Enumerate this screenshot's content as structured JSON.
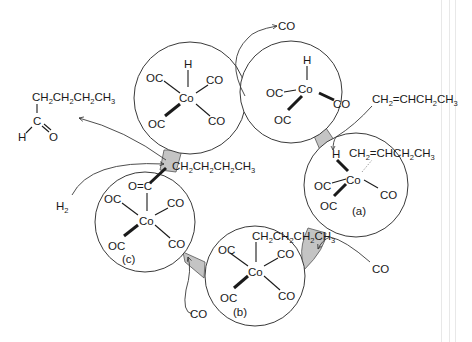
{
  "diagram": {
    "type": "catalytic-cycle",
    "product": {
      "chain": "CH2CH2CH2CH3",
      "carbon": "C",
      "hydrogen": "H",
      "oxygen": "O"
    },
    "reagents": {
      "co_out_top": "CO",
      "butene_in": "CH2=CHCH2CH3",
      "co_in_right": "CO",
      "co_in_bottom": "CO",
      "h2_in": "H2"
    },
    "complexes": [
      {
        "id": "HCo(CO)4",
        "center": "Co",
        "ligands": {
          "top": "H",
          "upper_left": "OC",
          "upper_right": "CO",
          "lower_left": "OC",
          "lower_right": "CO"
        }
      },
      {
        "id": "HCo(CO)3",
        "center": "Co",
        "ligands": {
          "top": "H",
          "left": "OC",
          "right": "CO",
          "lower_left": "OC"
        }
      },
      {
        "id": "a",
        "label": "(a)",
        "center": "Co",
        "ligands": {
          "top_left": "H",
          "pi": "CH2=CHCH2CH3",
          "left": "OC",
          "right": "CO",
          "lower_left": "OC"
        }
      },
      {
        "id": "b",
        "label": "(b)",
        "center": "Co",
        "ligands": {
          "top": "CH2CH2CH2CH3",
          "upper_left": "OC",
          "upper_right": "CO",
          "lower_left": "OC",
          "lower_right": "CO"
        }
      },
      {
        "id": "c",
        "label": "(c)",
        "center": "Co",
        "ligands": {
          "top": "O=C",
          "acyl_chain": "CH2CH2CH2CH3",
          "upper_left": "OC",
          "upper_right": "CO",
          "lower_left": "OC",
          "lower_right": "CO"
        }
      }
    ],
    "colors": {
      "connector": "#c4c4c4",
      "line": "#3a3a3a",
      "text": "#1a1a1a",
      "background": "#ffffff"
    }
  }
}
